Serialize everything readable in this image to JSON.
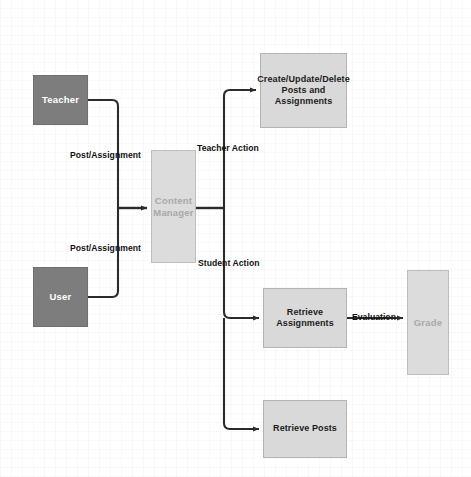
{
  "diagram": {
    "type": "flowchart",
    "canvas": {
      "width": 471,
      "height": 477,
      "background": "#ffffff"
    },
    "colors": {
      "actor_fill": "#7d7d7d",
      "actor_text": "#ffffff",
      "process_fill": "#d9d9d9",
      "process_text": "#1c1c1c",
      "muted_fill": "#dcdcdc",
      "muted_text": "#a8a8a8",
      "connector": "#2b2b2b"
    },
    "nodes": {
      "teacher": {
        "label": "Teacher"
      },
      "user": {
        "label": "User"
      },
      "content_manager": {
        "label": "Content\nManager"
      },
      "create_update_delete": {
        "label": "Create/Update/Delete\nPosts and\nAssignments"
      },
      "retrieve_assignments": {
        "label": "Retrieve\nAssignments"
      },
      "retrieve_posts": {
        "label": "Retrieve Posts"
      },
      "grade": {
        "label": "Grade"
      }
    },
    "edge_labels": {
      "post_assignment_top": "Post/Assignment",
      "post_assignment_bottom": "Post/Assignment",
      "teacher_action": "Teacher Action",
      "student_action": "Student Action",
      "evaluation": "Evaluation"
    }
  }
}
